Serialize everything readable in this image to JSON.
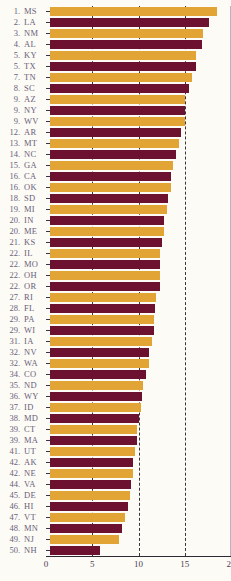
{
  "chart": {
    "title": "",
    "type": "bar"
  },
  "axis": {
    "ticks": [
      "0",
      "5",
      "10",
      "15",
      "20"
    ]
  },
  "colors": {
    "amber": "#e3a436",
    "maroon": "#6d1130",
    "label_text": "#6b5f7a",
    "gridline": "#3a3340",
    "background": "#fcfbf6"
  },
  "chart_data": {
    "type": "bar",
    "orientation": "horizontal",
    "title": "",
    "xlabel": "",
    "ylabel": "",
    "xlim": [
      0,
      20
    ],
    "xticks": [
      0,
      5,
      10,
      15,
      20
    ],
    "gridlines": [
      5,
      10,
      15
    ],
    "grid": true,
    "legend": "none",
    "sort": "descending",
    "categories": [
      "MS",
      "LA",
      "NM",
      "AL",
      "KY",
      "TX",
      "TN",
      "SC",
      "AZ",
      "NY",
      "WV",
      "AR",
      "MT",
      "NC",
      "GA",
      "CA",
      "OK",
      "SD",
      "MI",
      "IN",
      "ME",
      "KS",
      "IL",
      "MO",
      "OH",
      "OR",
      "RI",
      "FL",
      "PA",
      "WI",
      "IA",
      "NV",
      "WA",
      "CO",
      "ND",
      "WY",
      "ID",
      "MD",
      "CT",
      "MA",
      "UT",
      "AK",
      "NE",
      "VA",
      "DE",
      "HI",
      "VT",
      "MN",
      "NJ",
      "NH"
    ],
    "values": [
      18.1,
      17.2,
      16.5,
      16.4,
      15.8,
      15.8,
      15.3,
      15.0,
      14.6,
      14.6,
      14.6,
      14.2,
      13.9,
      13.6,
      13.3,
      13.1,
      13.1,
      12.8,
      12.6,
      12.3,
      12.3,
      12.1,
      11.9,
      11.9,
      11.9,
      11.9,
      11.5,
      11.3,
      11.2,
      11.2,
      11.0,
      10.7,
      10.7,
      10.4,
      10.1,
      9.9,
      9.8,
      9.6,
      9.4,
      9.4,
      9.2,
      9.0,
      9.0,
      8.8,
      8.6,
      8.4,
      8.1,
      7.8,
      7.5,
      5.4
    ],
    "ranks": [
      1,
      2,
      3,
      4,
      5,
      5,
      7,
      8,
      9,
      9,
      9,
      12,
      13,
      14,
      15,
      16,
      16,
      18,
      19,
      20,
      20,
      21,
      22,
      22,
      22,
      22,
      27,
      28,
      29,
      29,
      31,
      32,
      32,
      34,
      35,
      36,
      37,
      38,
      39,
      39,
      41,
      42,
      42,
      44,
      45,
      46,
      47,
      48,
      49,
      50
    ],
    "bar_colors": [
      "amber",
      "maroon",
      "amber",
      "maroon",
      "amber",
      "maroon",
      "amber",
      "maroon",
      "amber",
      "maroon",
      "amber",
      "maroon",
      "amber",
      "maroon",
      "amber",
      "maroon",
      "amber",
      "maroon",
      "amber",
      "maroon",
      "amber",
      "maroon",
      "amber",
      "maroon",
      "amber",
      "maroon",
      "amber",
      "maroon",
      "amber",
      "maroon",
      "amber",
      "maroon",
      "amber",
      "maroon",
      "amber",
      "maroon",
      "amber",
      "maroon",
      "amber",
      "maroon",
      "amber",
      "maroon",
      "amber",
      "maroon",
      "amber",
      "maroon",
      "amber",
      "maroon",
      "amber",
      "maroon"
    ]
  },
  "rows": [
    {
      "rank": "1.",
      "abbr": "MS",
      "value": 18.1,
      "color": "amber"
    },
    {
      "rank": "2.",
      "abbr": "LA",
      "value": 17.2,
      "color": "maroon"
    },
    {
      "rank": "3.",
      "abbr": "NM",
      "value": 16.5,
      "color": "amber"
    },
    {
      "rank": "4.",
      "abbr": "AL",
      "value": 16.4,
      "color": "maroon"
    },
    {
      "rank": "5.",
      "abbr": "KY",
      "value": 15.8,
      "color": "amber"
    },
    {
      "rank": "5.",
      "abbr": "TX",
      "value": 15.8,
      "color": "maroon"
    },
    {
      "rank": "7.",
      "abbr": "TN",
      "value": 15.3,
      "color": "amber"
    },
    {
      "rank": "8.",
      "abbr": "SC",
      "value": 15.0,
      "color": "maroon"
    },
    {
      "rank": "9.",
      "abbr": "AZ",
      "value": 14.6,
      "color": "amber"
    },
    {
      "rank": "9.",
      "abbr": "NY",
      "value": 14.6,
      "color": "maroon"
    },
    {
      "rank": "9.",
      "abbr": "WV",
      "value": 14.6,
      "color": "amber"
    },
    {
      "rank": "12.",
      "abbr": "AR",
      "value": 14.2,
      "color": "maroon"
    },
    {
      "rank": "13.",
      "abbr": "MT",
      "value": 13.9,
      "color": "amber"
    },
    {
      "rank": "14.",
      "abbr": "NC",
      "value": 13.6,
      "color": "maroon"
    },
    {
      "rank": "15.",
      "abbr": "GA",
      "value": 13.3,
      "color": "amber"
    },
    {
      "rank": "16.",
      "abbr": "CA",
      "value": 13.1,
      "color": "maroon"
    },
    {
      "rank": "16.",
      "abbr": "OK",
      "value": 13.1,
      "color": "amber"
    },
    {
      "rank": "18.",
      "abbr": "SD",
      "value": 12.8,
      "color": "maroon"
    },
    {
      "rank": "19.",
      "abbr": "MI",
      "value": 12.6,
      "color": "amber"
    },
    {
      "rank": "20.",
      "abbr": "IN",
      "value": 12.3,
      "color": "maroon"
    },
    {
      "rank": "20.",
      "abbr": "ME",
      "value": 12.3,
      "color": "amber"
    },
    {
      "rank": "21.",
      "abbr": "KS",
      "value": 12.1,
      "color": "maroon"
    },
    {
      "rank": "22.",
      "abbr": "IL",
      "value": 11.9,
      "color": "amber"
    },
    {
      "rank": "22.",
      "abbr": "MO",
      "value": 11.9,
      "color": "maroon"
    },
    {
      "rank": "22.",
      "abbr": "OH",
      "value": 11.9,
      "color": "amber"
    },
    {
      "rank": "22.",
      "abbr": "OR",
      "value": 11.9,
      "color": "maroon"
    },
    {
      "rank": "27.",
      "abbr": "RI",
      "value": 11.5,
      "color": "amber"
    },
    {
      "rank": "28.",
      "abbr": "FL",
      "value": 11.3,
      "color": "maroon"
    },
    {
      "rank": "29.",
      "abbr": "PA",
      "value": 11.2,
      "color": "amber"
    },
    {
      "rank": "29.",
      "abbr": "WI",
      "value": 11.2,
      "color": "maroon"
    },
    {
      "rank": "31.",
      "abbr": "IA",
      "value": 11.0,
      "color": "amber"
    },
    {
      "rank": "32.",
      "abbr": "NV",
      "value": 10.7,
      "color": "maroon"
    },
    {
      "rank": "32.",
      "abbr": "WA",
      "value": 10.7,
      "color": "amber"
    },
    {
      "rank": "34.",
      "abbr": "CO",
      "value": 10.4,
      "color": "maroon"
    },
    {
      "rank": "35.",
      "abbr": "ND",
      "value": 10.1,
      "color": "amber"
    },
    {
      "rank": "36.",
      "abbr": "WY",
      "value": 9.9,
      "color": "maroon"
    },
    {
      "rank": "37.",
      "abbr": "ID",
      "value": 9.8,
      "color": "amber"
    },
    {
      "rank": "38.",
      "abbr": "MD",
      "value": 9.6,
      "color": "maroon"
    },
    {
      "rank": "39.",
      "abbr": "CT",
      "value": 9.4,
      "color": "amber"
    },
    {
      "rank": "39.",
      "abbr": "MA",
      "value": 9.4,
      "color": "maroon"
    },
    {
      "rank": "41.",
      "abbr": "UT",
      "value": 9.2,
      "color": "amber"
    },
    {
      "rank": "42.",
      "abbr": "AK",
      "value": 9.0,
      "color": "maroon"
    },
    {
      "rank": "42.",
      "abbr": "NE",
      "value": 9.0,
      "color": "amber"
    },
    {
      "rank": "44.",
      "abbr": "VA",
      "value": 8.8,
      "color": "maroon"
    },
    {
      "rank": "45.",
      "abbr": "DE",
      "value": 8.6,
      "color": "amber"
    },
    {
      "rank": "46.",
      "abbr": "HI",
      "value": 8.4,
      "color": "maroon"
    },
    {
      "rank": "47.",
      "abbr": "VT",
      "value": 8.1,
      "color": "amber"
    },
    {
      "rank": "48.",
      "abbr": "MN",
      "value": 7.8,
      "color": "maroon"
    },
    {
      "rank": "49.",
      "abbr": "NJ",
      "value": 7.5,
      "color": "amber"
    },
    {
      "rank": "50.",
      "abbr": "NH",
      "value": 5.4,
      "color": "maroon"
    }
  ]
}
